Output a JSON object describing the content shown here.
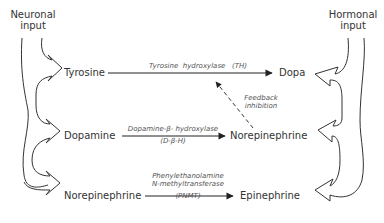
{
  "inputs": {
    "left": {
      "line1": "Neuronal",
      "line2": "input"
    },
    "right": {
      "line1": "Hormonal",
      "line2": "input"
    }
  },
  "nodes": {
    "tyrosine": "Tyrosine",
    "dopa": "Dopa",
    "dopamine": "Dopamine",
    "norepinephrine_mid": "Norepinephrine",
    "norepinephrine_low": "Norepinephrine",
    "epinephrine": "Epinephrine"
  },
  "enzymes": {
    "th": "Tyrosine  hydroxylase   (TH)",
    "dbh_line1": "Dopamine-β- hydroxylase",
    "dbh_line2": "(D-β-H)",
    "pnmt_line1": "Phenylethanolamine",
    "pnmt_line2": "N-methyltransferase",
    "pnmt_line3": "(PNMT)"
  },
  "feedback": {
    "line1": "Feedback",
    "line2": "inhibition"
  },
  "colors": {
    "stroke": "#333333",
    "text": "#333333",
    "enzyme_text": "#555555"
  }
}
